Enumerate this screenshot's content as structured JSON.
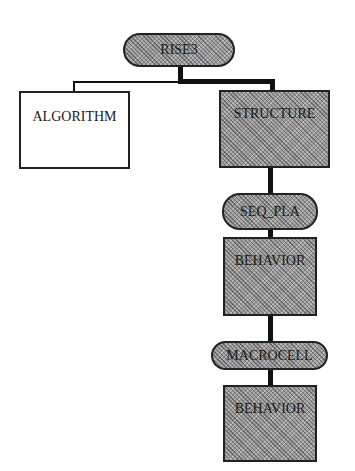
{
  "diagram": {
    "type": "hierarchy-tree",
    "root": {
      "label": "RISE3",
      "shape": "pill"
    },
    "nodes": [
      {
        "id": "algorithm",
        "label": "ALGORITHM",
        "shape": "box",
        "fill": "white"
      },
      {
        "id": "structure",
        "label": "STRUCTURE",
        "shape": "box",
        "fill": "hatched-gray"
      },
      {
        "id": "seq_pla",
        "label": "SEQ_PLA",
        "shape": "pill",
        "fill": "hatched-gray"
      },
      {
        "id": "behavior1",
        "label": "BEHAVIOR",
        "shape": "box",
        "fill": "hatched-gray"
      },
      {
        "id": "macrocell",
        "label": "MACROCELL",
        "shape": "pill",
        "fill": "hatched-gray"
      },
      {
        "id": "behavior2",
        "label": "BEHAVIOR",
        "shape": "box",
        "fill": "hatched-gray"
      }
    ],
    "edges": [
      {
        "from": "RISE3",
        "to": "algorithm",
        "weight": "thin"
      },
      {
        "from": "RISE3",
        "to": "structure",
        "weight": "thick"
      },
      {
        "from": "structure",
        "to": "seq_pla",
        "weight": "thick"
      },
      {
        "from": "seq_pla",
        "to": "behavior1",
        "weight": "thick"
      },
      {
        "from": "behavior1",
        "to": "macrocell",
        "weight": "thick"
      },
      {
        "from": "macrocell",
        "to": "behavior2",
        "weight": "thick"
      }
    ],
    "colors": {
      "line": "#111111",
      "fill": "#9a9a9a",
      "background": "#ffffff"
    }
  }
}
